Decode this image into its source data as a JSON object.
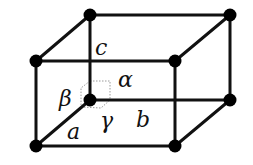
{
  "diagram": {
    "colors": {
      "edge": "#111111",
      "node": "#000000",
      "angle_marker": "#9a9a9a",
      "background": "#ffffff"
    },
    "nodes": [
      {
        "id": "origin",
        "x": 90,
        "y": 100
      },
      {
        "id": "a",
        "x": 36,
        "y": 146
      },
      {
        "id": "b",
        "x": 230,
        "y": 100
      },
      {
        "id": "ab",
        "x": 175,
        "y": 146
      },
      {
        "id": "c",
        "x": 90,
        "y": 15
      },
      {
        "id": "ac",
        "x": 36,
        "y": 61
      },
      {
        "id": "bc",
        "x": 230,
        "y": 15
      },
      {
        "id": "abc",
        "x": 175,
        "y": 61
      }
    ],
    "labels": {
      "a": "a",
      "b": "b",
      "c": "c",
      "alpha": "α",
      "beta": "β",
      "gamma": "γ"
    }
  }
}
